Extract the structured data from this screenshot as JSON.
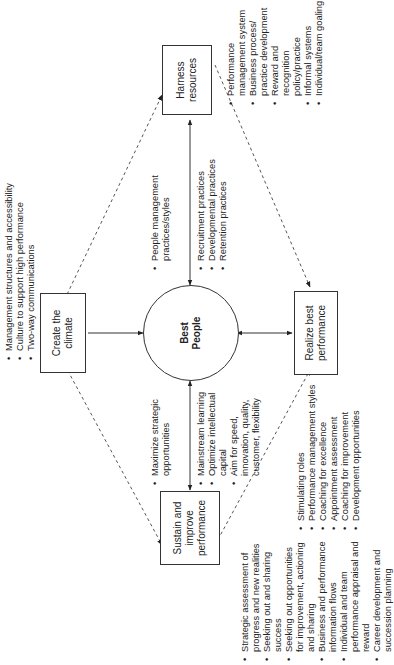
{
  "diagram": {
    "center": {
      "label_line1": "Best",
      "label_line2": "People"
    },
    "nodes": {
      "create_climate": {
        "line1": "Create the",
        "line2": "climate",
        "bullets": [
          "Management structures and accessibility",
          "Culture to support high performance",
          "Two-way communications"
        ]
      },
      "harness_resources": {
        "line1": "Harness",
        "line2": "resources",
        "bullets": [
          "Performance management system",
          "Business process/ practice development",
          "Reward and recognition policy/practice",
          "Informal systems",
          "Individual/team goaling"
        ]
      },
      "realize_best": {
        "line1": "Realize best",
        "line2": "performance",
        "bullets": [
          "Stimulating roles",
          "Performance management styles",
          "Coaching for excellence",
          "Appointment assessment",
          "Coaching for improvement",
          "Development opportunities"
        ]
      },
      "sustain_improve": {
        "line1": "Sustain and",
        "line2": "improve",
        "line3": "performance",
        "bullets": [
          "Strategic assessment of progress and new realities",
          "Seeking out and sharing success",
          "Seeking out opportunities for improvement, actioning and sharing",
          "Business and performance information flows",
          "Individual and team performance appraisal and reward",
          "Career development and succession planning"
        ]
      }
    },
    "link_labels": {
      "center_harness_top": [
        "People management practices/styles"
      ],
      "center_harness_bottom": [
        "Recruitment practices",
        "Developmental practices",
        "Retention practices"
      ],
      "center_sustain_top": [
        "Maximize strategic opportunities"
      ],
      "center_sustain_bottom": [
        "Mainstream learning",
        "Optimize intellectual capital",
        "Aim for speed, innovation, quality, customer, flexibility"
      ]
    }
  }
}
